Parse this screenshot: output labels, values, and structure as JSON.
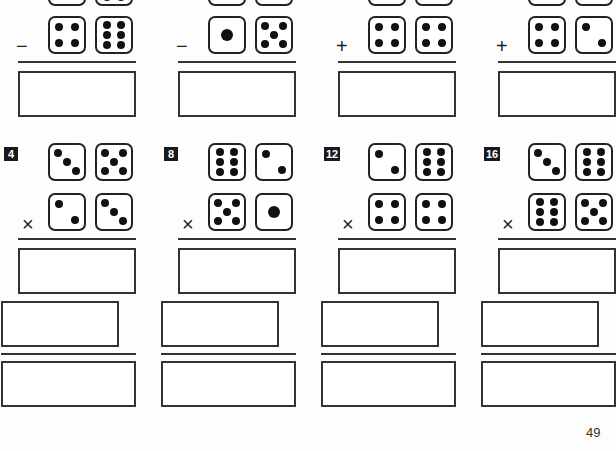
{
  "page": {
    "number": "49"
  },
  "colors": {
    "ink": "#1a1a1a",
    "paper": "#fdfdfd"
  },
  "row1": {
    "problems": [
      {
        "x": 18,
        "op": "−",
        "top_cut": [
          4,
          6
        ],
        "dice": [
          4,
          6
        ]
      },
      {
        "x": 178,
        "op": "−",
        "top_cut": [
          2,
          0
        ],
        "dice": [
          1,
          5
        ]
      },
      {
        "x": 338,
        "op": "+",
        "top_cut": [
          2,
          2
        ],
        "dice": [
          4,
          4
        ]
      },
      {
        "x": 498,
        "op": "+",
        "top_cut": [
          2,
          2
        ],
        "dice": [
          4,
          2
        ]
      }
    ]
  },
  "row2": {
    "problems": [
      {
        "x": 18,
        "label": "4",
        "op": "×",
        "top": [
          3,
          5
        ],
        "bottom": [
          2,
          3
        ]
      },
      {
        "x": 178,
        "label": "8",
        "op": "×",
        "top": [
          6,
          2
        ],
        "bottom": [
          5,
          1
        ]
      },
      {
        "x": 338,
        "label": "12",
        "op": "×",
        "top": [
          2,
          6
        ],
        "bottom": [
          4,
          4
        ]
      },
      {
        "x": 498,
        "label": "16",
        "op": "×",
        "top": [
          3,
          6
        ],
        "bottom": [
          6,
          5
        ]
      }
    ]
  }
}
